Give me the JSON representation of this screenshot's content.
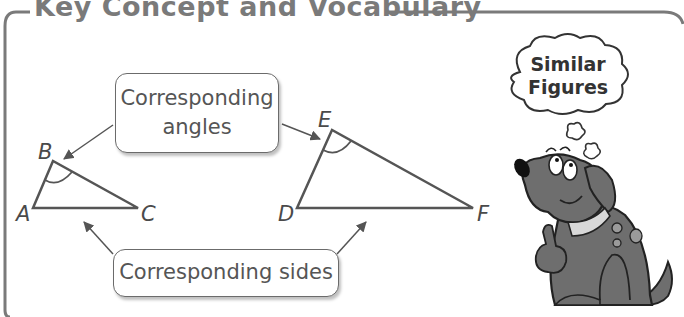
{
  "title": "Key Concept and Vocabulary",
  "labels": {
    "angles_line1": "Corresponding",
    "angles_line2": "angles",
    "sides": "Corresponding sides"
  },
  "triangle_small": {
    "vertices": {
      "A": "A",
      "B": "B",
      "C": "C"
    },
    "marked_angle": "B"
  },
  "triangle_large": {
    "vertices": {
      "D": "D",
      "E": "E",
      "F": "F"
    },
    "marked_angle": "E"
  },
  "mascot": {
    "thought_line1": "Similar",
    "thought_line2": "Figures"
  },
  "colors": {
    "frame": "#7a7a7a",
    "lines": "#555555",
    "dog_body": "#6e6e6e",
    "dog_outline": "#222222"
  }
}
